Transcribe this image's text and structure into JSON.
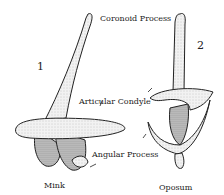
{
  "figure": {
    "labels": {
      "coronoid": "Coronoid Process",
      "articular": "Articular Condyle",
      "angular": "Angular Process"
    },
    "specimens": [
      {
        "number": "1",
        "name": "Mink"
      },
      {
        "number": "2",
        "name": "Oposum"
      }
    ],
    "colors": {
      "ink": "#222222",
      "fill": "#f4f4f4",
      "shade": "#bdbdbd"
    }
  }
}
